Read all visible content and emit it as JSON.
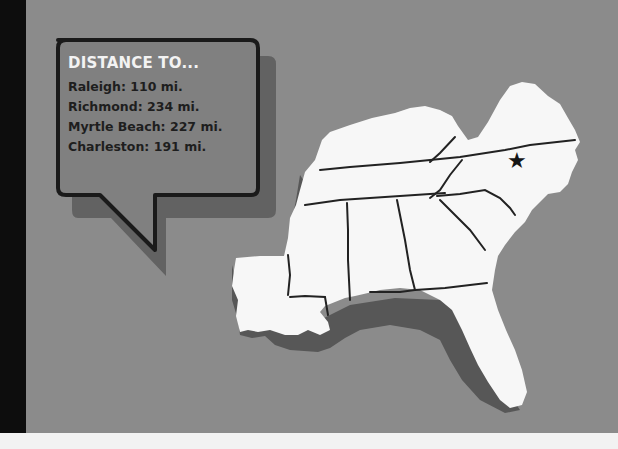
{
  "callout": {
    "title": "DISTANCE TO...",
    "destinations": [
      {
        "label": "Raleigh: 110 mi."
      },
      {
        "label": "Richmond: 234 mi."
      },
      {
        "label": "Myrtle Beach: 227 mi."
      },
      {
        "label": "Charleston: 191 mi."
      }
    ]
  },
  "map": {
    "region": "Southeastern United States",
    "marker": {
      "icon": "star-icon",
      "glyph": "★"
    }
  },
  "colors": {
    "background": "#8b8b8b",
    "left_band": "#0d0d0d",
    "land": "#f7f7f7",
    "land_shadow": "#555555",
    "borders": "#222222",
    "callout_fill": "#808080",
    "callout_border": "#1a1a1a",
    "title_text": "#f3f3f3",
    "body_text": "#1e1e1e"
  }
}
